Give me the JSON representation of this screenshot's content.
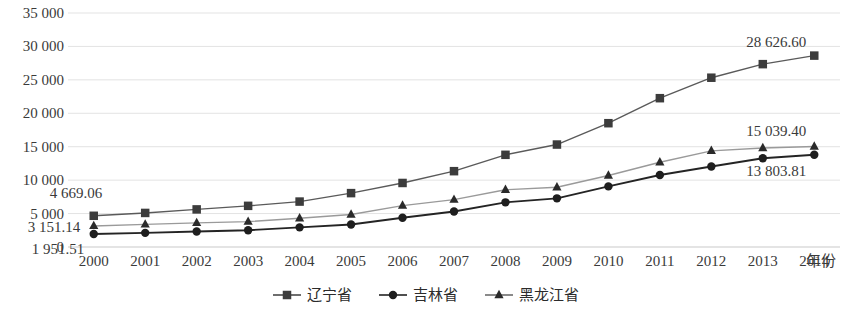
{
  "chart_data": {
    "type": "line",
    "title": "",
    "xlabel": "年份",
    "ylabel": "",
    "x": [
      "2000",
      "2001",
      "2002",
      "2003",
      "2004",
      "2005",
      "2006",
      "2007",
      "2008",
      "2009",
      "2010",
      "2011",
      "2012",
      "2013",
      "2014"
    ],
    "categories": [
      "2000",
      "2001",
      "2002",
      "2003",
      "2004",
      "2005",
      "2006",
      "2007",
      "2008",
      "2009",
      "2010",
      "2011",
      "2012",
      "2013",
      "2014"
    ],
    "ylim": [
      0,
      35000
    ],
    "yticks": [
      "0",
      "5 000",
      "10 000",
      "15 000",
      "20 000",
      "25 000",
      "30 000",
      "35 000"
    ],
    "ytick_values": [
      0,
      5000,
      10000,
      15000,
      20000,
      25000,
      30000,
      35000
    ],
    "grid": true,
    "legend_position": "bottom",
    "series": [
      {
        "name": "辽宁省",
        "marker": "square",
        "color": "#3c3c3c",
        "values": [
          4669.06,
          5096,
          5624,
          6156,
          6794,
          8059,
          9578,
          11341,
          13788,
          15324,
          18518,
          22258,
          25321,
          27350,
          28626.6
        ]
      },
      {
        "name": "吉林省",
        "marker": "circle",
        "color": "#1e1e1e",
        "values": [
          1951.51,
          2116,
          2327,
          2507,
          2936,
          3371,
          4373,
          5303,
          6682,
          7278,
          9067,
          10763,
          12031,
          13277,
          13803.81
        ]
      },
      {
        "name": "黑龙江省",
        "marker": "triangle",
        "color": "#2a2a2a",
        "values": [
          3151.14,
          3387,
          3605,
          3800,
          4290,
          4856,
          6195,
          7092,
          8559,
          8938,
          10699,
          12681,
          14384,
          14811,
          15039.4
        ]
      }
    ],
    "data_labels": [
      {
        "text": "4 669.06",
        "series": "辽宁省",
        "point": "2000"
      },
      {
        "text": "3 151.14",
        "series": "黑龙江省",
        "point": "2000"
      },
      {
        "text": "1 951.51",
        "series": "吉林省",
        "point": "2000"
      },
      {
        "text": "28 626.60",
        "series": "辽宁省",
        "point": "2014"
      },
      {
        "text": "15 039.40",
        "series": "黑龙江省",
        "point": "2014"
      },
      {
        "text": "13 803.81",
        "series": "吉林省",
        "point": "2014"
      }
    ]
  },
  "legend": {
    "items": [
      {
        "label": "辽宁省",
        "marker": "square-marker-icon"
      },
      {
        "label": "吉林省",
        "marker": "circle-marker-icon"
      },
      {
        "label": "黑龙江省",
        "marker": "triangle-marker-icon"
      }
    ]
  },
  "axis": {
    "x_title": "年份"
  }
}
